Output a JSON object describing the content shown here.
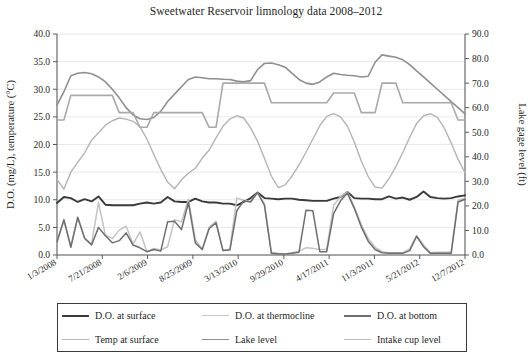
{
  "chart_data": {
    "type": "line",
    "title": "Sweetwater Reservoir limnology data 2008–2012",
    "xlabel": "",
    "ylabel": "D.O. (mg/L), temperature (°C)",
    "y2label": "Lake gage level (ft)",
    "ylim": [
      0.0,
      40.0
    ],
    "y2lim": [
      0.0,
      90.0
    ],
    "grid": true,
    "legend_position": "bottom",
    "ytick_labels": [
      "0.0",
      "5.0",
      "10.0",
      "15.0",
      "20.0",
      "25.0",
      "30.0",
      "35.0",
      "40.0"
    ],
    "ytick_values": [
      0,
      5,
      10,
      15,
      20,
      25,
      30,
      35,
      40
    ],
    "y2tick_labels": [
      "0.0",
      "10.0",
      "20.0",
      "30.0",
      "40.0",
      "50.0",
      "60.0",
      "70.0",
      "80.0",
      "90.0"
    ],
    "y2tick_values": [
      0,
      10,
      20,
      30,
      40,
      50,
      60,
      70,
      80,
      90
    ],
    "xtick_labels": [
      "1/3/2008",
      "7/21/2008",
      "2/6/2009",
      "8/25/2009",
      "3/13/2010",
      "9/29/2010",
      "4/17/2011",
      "11/3/2011",
      "5/21/2012",
      "12/7/2012"
    ],
    "xtick_positions": [
      0,
      0.111,
      0.222,
      0.333,
      0.444,
      0.556,
      0.667,
      0.778,
      0.889,
      1.0
    ],
    "series": [
      {
        "name": "D.O. at surface",
        "axis": "left",
        "color": "#3a3a3a",
        "width": 1.9,
        "values": [
          9.4,
          10.5,
          10.3,
          9.6,
          10.1,
          9.7,
          10.6,
          9.1,
          9.0,
          9.0,
          9.0,
          9.0,
          9.3,
          9.5,
          9.3,
          9.5,
          10.5,
          9.7,
          9.6,
          9.6,
          10.2,
          9.7,
          9.5,
          9.5,
          9.3,
          9.3,
          9.0,
          9.6,
          10.3,
          11.3,
          10.3,
          10.2,
          10.1,
          10.2,
          10.2,
          10.0,
          9.9,
          9.8,
          9.8,
          9.8,
          10.2,
          10.5,
          11.4,
          10.3,
          10.2,
          10.2,
          10.1,
          10.1,
          10.6,
          10.2,
          10.4,
          10.0,
          10.5,
          11.5,
          10.5,
          10.3,
          10.2,
          10.3,
          10.6,
          10.8
        ]
      },
      {
        "name": "D.O. at thermocline",
        "axis": "left",
        "color": "#c3c3c3",
        "width": 1.5,
        "values": [
          2.4,
          6.2,
          1.6,
          6.9,
          3.1,
          2.0,
          9.5,
          3.6,
          3.0,
          4.5,
          5.2,
          2.0,
          4.2,
          0.6,
          1.2,
          0.9,
          1.5,
          6.4,
          6.0,
          10.1,
          2.8,
          1.0,
          5.0,
          6.1,
          0.8,
          1.1,
          10.3,
          9.9,
          9.7,
          11.3,
          9.2,
          0.5,
          0.3,
          0.2,
          0.4,
          0.7,
          1.3,
          1.2,
          1.0,
          1.0,
          9.0,
          10.6,
          11.4,
          8.7,
          5.5,
          3.0,
          1.4,
          0.6,
          0.4,
          0.4,
          0.4,
          1.1,
          3.5,
          1.8,
          0.4,
          0.5,
          0.5,
          0.5,
          9.9,
          10.3
        ]
      },
      {
        "name": "D.O. at bottom",
        "axis": "left",
        "color": "#6e6e6e",
        "width": 1.5,
        "values": [
          2.4,
          6.4,
          1.4,
          6.8,
          3.0,
          1.8,
          5.0,
          3.5,
          2.2,
          2.6,
          4.0,
          1.8,
          1.3,
          0.6,
          1.0,
          0.7,
          6.0,
          6.1,
          4.6,
          9.5,
          2.2,
          1.0,
          4.8,
          5.8,
          0.8,
          0.9,
          8.0,
          9.8,
          9.6,
          11.3,
          9.0,
          0.3,
          0.2,
          0.2,
          0.3,
          0.5,
          8.1,
          8.0,
          0.6,
          0.6,
          7.5,
          9.8,
          11.2,
          8.4,
          5.1,
          2.5,
          1.0,
          0.4,
          0.3,
          0.3,
          0.3,
          0.8,
          3.4,
          1.5,
          0.3,
          0.3,
          0.3,
          0.3,
          9.6,
          10.1
        ]
      },
      {
        "name": "Temp at surface",
        "axis": "left",
        "color": "#b4b4b4",
        "width": 1.4,
        "values": [
          13.7,
          11.9,
          15.0,
          16.8,
          18.5,
          20.8,
          22.1,
          23.5,
          24.3,
          24.8,
          24.6,
          24.2,
          23.2,
          21.0,
          18.2,
          15.5,
          13.2,
          12.0,
          13.6,
          14.8,
          15.7,
          17.5,
          19.0,
          21.2,
          23.3,
          24.6,
          25.2,
          24.8,
          23.0,
          20.6,
          17.5,
          14.3,
          12.2,
          12.7,
          14.3,
          16.3,
          18.6,
          21.0,
          23.4,
          25.1,
          25.6,
          25.0,
          23.3,
          20.4,
          17.0,
          14.2,
          12.3,
          12.1,
          13.8,
          16.0,
          18.5,
          21.3,
          23.8,
          25.2,
          25.6,
          24.9,
          23.0,
          20.3,
          17.3,
          14.9
        ]
      },
      {
        "name": "Lake level",
        "axis": "right",
        "color": "#8f8f8f",
        "width": 1.6,
        "values": [
          61.0,
          66.5,
          73.0,
          74.0,
          74.3,
          73.8,
          72.5,
          70.5,
          67.5,
          64.0,
          60.0,
          57.0,
          55.5,
          55.2,
          56.0,
          58.5,
          62.5,
          65.5,
          68.5,
          71.5,
          72.5,
          72.2,
          71.8,
          71.8,
          71.6,
          71.5,
          70.8,
          70.5,
          71.0,
          75.5,
          78.0,
          78.2,
          77.5,
          76.5,
          74.0,
          71.5,
          70.0,
          69.5,
          70.5,
          72.5,
          74.0,
          73.5,
          73.2,
          73.0,
          72.5,
          72.8,
          78.5,
          81.5,
          81.0,
          80.5,
          79.5,
          77.5,
          75.0,
          72.5,
          70.0,
          67.5,
          65.0,
          62.5,
          60.0,
          57.5
        ]
      },
      {
        "name": "Intake cup level",
        "axis": "right",
        "color": "#a9a9a9",
        "width": 1.6,
        "values": [
          55.0,
          55.0,
          65.0,
          65.0,
          65.0,
          65.0,
          65.0,
          65.0,
          65.0,
          58.0,
          58.0,
          58.0,
          52.0,
          52.0,
          58.0,
          58.0,
          58.0,
          58.0,
          58.0,
          58.0,
          58.0,
          58.0,
          52.0,
          52.0,
          70.0,
          70.0,
          70.0,
          70.0,
          70.0,
          70.0,
          70.0,
          62.0,
          62.0,
          62.0,
          62.0,
          62.0,
          62.0,
          62.0,
          62.0,
          62.0,
          66.0,
          66.0,
          66.0,
          66.0,
          58.0,
          58.0,
          58.0,
          70.0,
          70.0,
          70.0,
          62.0,
          62.0,
          62.0,
          62.0,
          62.0,
          62.0,
          62.0,
          62.0,
          55.0,
          55.0
        ]
      }
    ]
  },
  "legend": {
    "items": [
      {
        "label": "D.O. at surface",
        "color": "#3a3a3a",
        "width": "2.4px"
      },
      {
        "label": "D.O. at thermocline",
        "color": "#c6c6c6",
        "width": "1.6px"
      },
      {
        "label": "D.O. at bottom",
        "color": "#6e6e6e",
        "width": "2px"
      },
      {
        "label": "Temp at surface",
        "color": "#b8b8b8",
        "width": "1.6px"
      },
      {
        "label": "Lake level",
        "color": "#8f8f8f",
        "width": "1.8px"
      },
      {
        "label": "Intake cup level",
        "color": "#bcbcbc",
        "width": "1.5px"
      }
    ]
  },
  "colors": {
    "grid": "#e2e2e2",
    "axis": "#5a5a5a",
    "text": "#1f1f1f",
    "background": "#ffffff"
  }
}
